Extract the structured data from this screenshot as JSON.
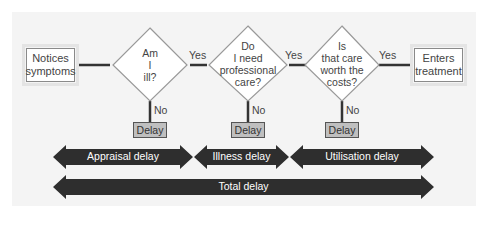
{
  "flow": {
    "start": "Notices symptoms",
    "end": "Enters treatment",
    "decisions": [
      {
        "question_lines": [
          "Am",
          "I",
          "ill?"
        ],
        "yes": "Yes",
        "no": "No",
        "no_outcome": "Delay"
      },
      {
        "question_lines": [
          "Do",
          "I need",
          "professional",
          "care?"
        ],
        "yes": "Yes",
        "no": "No",
        "no_outcome": "Delay"
      },
      {
        "question_lines": [
          "Is",
          "that care",
          "worth the",
          "costs?"
        ],
        "yes": "Yes",
        "no": "No",
        "no_outcome": "Delay"
      }
    ]
  },
  "phases": [
    {
      "label": "Appraisal delay"
    },
    {
      "label": "Illness delay"
    },
    {
      "label": "Utilisation delay"
    }
  ],
  "total": {
    "label": "Total delay"
  },
  "colors": {
    "panel": "#f4f4f4",
    "arrow": "#2e2e2e",
    "delay_box": "#bfbfbf",
    "line": "#333333"
  }
}
